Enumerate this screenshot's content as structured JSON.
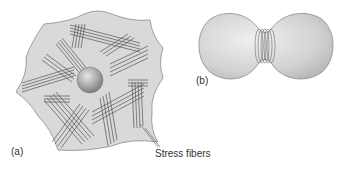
{
  "figure": {
    "panels": [
      {
        "id": "a",
        "label": "(a)",
        "description": "Flattened cell with bundles of stress fibers and a central nucleus",
        "callout": "Stress fibers"
      },
      {
        "id": "b",
        "label": "(b)",
        "description": "Dividing cell constricted by a contractile ring"
      }
    ],
    "colors": {
      "cell_fill": "#d9d9d9",
      "cell_outline": "#8a8a8a",
      "fiber": "#555555",
      "nucleus": "#9a9a9a",
      "text": "#333333"
    }
  }
}
